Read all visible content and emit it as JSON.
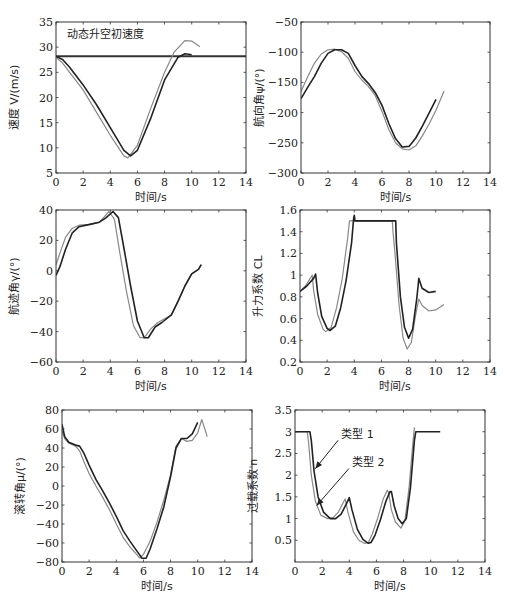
{
  "chart_data": [
    {
      "id": "speed",
      "type": "line",
      "frame": {
        "x": 56,
        "y": 22,
        "w": 190,
        "h": 151
      },
      "xlabel": "时间/s",
      "ylabel": "速度 V/(m/s)",
      "xlim": [
        0,
        14
      ],
      "ylim": [
        5,
        35
      ],
      "xticks": [
        0,
        2,
        4,
        6,
        8,
        10,
        12,
        14
      ],
      "yticks": [
        5,
        10,
        15,
        20,
        25,
        30,
        35
      ],
      "annotations": [
        {
          "text": "动态升空初速度",
          "x": 0.8,
          "y": 31.8
        }
      ],
      "hlines": [
        {
          "y": 28.2,
          "width": 2.2,
          "color": "#333333"
        }
      ],
      "series": [
        {
          "name": "类型 1",
          "color": "#222222",
          "width": 1.6,
          "x": [
            0,
            0.5,
            1,
            2,
            3,
            4,
            5,
            5.5,
            6,
            7,
            8,
            9,
            9.5,
            10
          ],
          "y": [
            28.2,
            27.5,
            26,
            22.5,
            18.5,
            14,
            9.5,
            8.4,
            9.5,
            16,
            23.5,
            28,
            28.7,
            28.5
          ]
        },
        {
          "name": "类型 2",
          "color": "#888888",
          "width": 1.2,
          "x": [
            0,
            0.5,
            1,
            2,
            3,
            4,
            5,
            5.3,
            6,
            7,
            8,
            8.7,
            9.5,
            10,
            10.6
          ],
          "y": [
            28,
            26.8,
            25,
            21.5,
            17,
            12.5,
            8.4,
            8,
            10.5,
            18,
            25,
            29,
            31.3,
            31.2,
            30.1
          ]
        }
      ]
    },
    {
      "id": "heading",
      "type": "line",
      "frame": {
        "x": 301,
        "y": 22,
        "w": 189,
        "h": 151
      },
      "xlabel": "时间/s",
      "ylabel": "航向角ψ/(°)",
      "xlim": [
        0,
        14
      ],
      "ylim": [
        -300,
        -50
      ],
      "xticks": [
        0,
        2,
        4,
        6,
        8,
        10,
        12,
        14
      ],
      "yticks": [
        -300,
        -250,
        -200,
        -150,
        -100,
        -50
      ],
      "annotations": [],
      "hlines": [],
      "series": [
        {
          "name": "类型 1",
          "color": "#222222",
          "width": 1.6,
          "x": [
            0,
            0.5,
            1,
            1.5,
            2,
            2.5,
            3,
            3.5,
            4,
            4.5,
            5,
            5.5,
            6,
            6.5,
            7,
            7.5,
            8,
            8.5,
            9,
            9.5,
            10
          ],
          "y": [
            -177,
            -158,
            -140,
            -118,
            -102,
            -96,
            -96,
            -102,
            -122,
            -140,
            -152,
            -167,
            -188,
            -218,
            -243,
            -257,
            -256,
            -242,
            -222,
            -200,
            -178
          ]
        },
        {
          "name": "类型 2",
          "color": "#888888",
          "width": 1.2,
          "x": [
            0,
            0.5,
            1,
            1.5,
            2,
            2.5,
            3,
            3.5,
            4,
            4.5,
            5,
            5.5,
            6,
            6.5,
            7,
            7.5,
            8,
            8.5,
            9,
            9.5,
            10,
            10.6
          ],
          "y": [
            -165,
            -140,
            -118,
            -103,
            -96,
            -95,
            -99,
            -110,
            -132,
            -146,
            -157,
            -172,
            -198,
            -228,
            -250,
            -260,
            -262,
            -255,
            -238,
            -218,
            -196,
            -164
          ]
        }
      ]
    },
    {
      "id": "flight-path",
      "type": "line",
      "frame": {
        "x": 56,
        "y": 210,
        "w": 190,
        "h": 152
      },
      "xlabel": "时间/s",
      "ylabel": "航迹角γ/(°)",
      "xlim": [
        0,
        14
      ],
      "ylim": [
        -60,
        40
      ],
      "xticks": [
        0,
        2,
        4,
        6,
        8,
        10,
        12,
        14
      ],
      "yticks": [
        -60,
        -40,
        -20,
        0,
        20,
        40
      ],
      "annotations": [],
      "hlines": [],
      "series": [
        {
          "name": "类型 1",
          "color": "#222222",
          "width": 1.6,
          "x": [
            0,
            0.3,
            0.7,
            1.2,
            1.7,
            2.5,
            3.2,
            3.7,
            4.2,
            4.6,
            5,
            5.5,
            6,
            6.5,
            6.8,
            7.3,
            7.8,
            8.5,
            9,
            9.5,
            10,
            10.5,
            10.7
          ],
          "y": [
            -3,
            3,
            14,
            25,
            29,
            30.5,
            32,
            35,
            39,
            35,
            15,
            -10,
            -33,
            -44,
            -44,
            -37,
            -34,
            -29,
            -20,
            -10,
            -2,
            1,
            4
          ]
        },
        {
          "name": "类型 2",
          "color": "#888888",
          "width": 1.2,
          "x": [
            0,
            0.3,
            0.7,
            1.2,
            1.7,
            2.5,
            3.2,
            3.6,
            3.9,
            4.3,
            4.7,
            5.2,
            5.7,
            6.2,
            6.5,
            7,
            7.5,
            8.5,
            9,
            9.5,
            10,
            10.5,
            10.7
          ],
          "y": [
            4,
            12,
            22,
            28,
            30,
            30.5,
            32,
            36,
            39,
            34,
            12,
            -14,
            -36,
            -44,
            -44,
            -38,
            -34,
            -29,
            -20,
            -10,
            -2,
            1,
            4
          ]
        }
      ]
    },
    {
      "id": "lift-coefficient",
      "type": "line",
      "frame": {
        "x": 300,
        "y": 210,
        "w": 190,
        "h": 152
      },
      "xlabel": "时间/s",
      "ylabel": "升力系数 CL",
      "xlim": [
        0,
        14
      ],
      "ylim": [
        0.2,
        1.6
      ],
      "xticks": [
        0,
        2,
        4,
        6,
        8,
        10,
        12,
        14
      ],
      "yticks": [
        0.2,
        0.4,
        0.6,
        0.8,
        1,
        1.2,
        1.4,
        1.6
      ],
      "annotations": [],
      "hlines": [],
      "series": [
        {
          "name": "类型 1",
          "color": "#222222",
          "width": 1.6,
          "x": [
            0,
            0.5,
            1,
            1.15,
            1.3,
            1.6,
            2,
            2.2,
            2.6,
            3,
            3.4,
            3.8,
            3.95,
            4.0,
            4.05,
            5,
            6,
            7.0,
            7.05,
            7.1,
            7.4,
            7.7,
            8.0,
            8.3,
            8.6,
            8.7,
            8.75,
            9,
            9.5,
            10
          ],
          "y": [
            0.85,
            0.9,
            0.97,
            1.01,
            0.84,
            0.62,
            0.51,
            0.49,
            0.53,
            0.7,
            0.95,
            1.3,
            1.52,
            1.55,
            1.5,
            1.5,
            1.5,
            1.5,
            1.5,
            1.3,
            0.8,
            0.52,
            0.42,
            0.5,
            0.78,
            0.9,
            0.97,
            0.88,
            0.84,
            0.85
          ]
        },
        {
          "name": "类型 2",
          "color": "#888888",
          "width": 1.2,
          "x": [
            0,
            0.4,
            0.8,
            0.9,
            1.0,
            1.3,
            1.7,
            1.9,
            2.3,
            2.7,
            3.1,
            3.5,
            3.65,
            3.7,
            5,
            6.8,
            6.85,
            7.0,
            7.3,
            7.6,
            7.9,
            8.2,
            8.5,
            8.7,
            8.75,
            9,
            9.5,
            10,
            10.6
          ],
          "y": [
            0.85,
            0.9,
            0.98,
            1.0,
            0.86,
            0.64,
            0.5,
            0.48,
            0.52,
            0.7,
            0.96,
            1.33,
            1.5,
            1.5,
            1.5,
            1.5,
            1.4,
            1.2,
            0.72,
            0.42,
            0.32,
            0.38,
            0.62,
            0.75,
            0.78,
            0.72,
            0.67,
            0.68,
            0.73
          ]
        }
      ]
    },
    {
      "id": "roll-angle",
      "type": "line",
      "frame": {
        "x": 62,
        "y": 410,
        "w": 190,
        "h": 152
      },
      "xlabel": "时间/s",
      "ylabel": "滚转角μ/(°)",
      "xlim": [
        0,
        14
      ],
      "ylim": [
        -80,
        80
      ],
      "xticks": [
        0,
        2,
        4,
        6,
        8,
        10,
        12,
        14
      ],
      "yticks": [
        -80,
        -60,
        -40,
        -20,
        0,
        20,
        40,
        60,
        80
      ],
      "annotations": [],
      "hlines": [],
      "series": [
        {
          "name": "类型 1",
          "color": "#222222",
          "width": 1.6,
          "x": [
            0,
            0.2,
            0.5,
            1,
            1.3,
            1.6,
            2,
            2.5,
            3,
            3.5,
            4,
            4.5,
            5,
            5.5,
            5.9,
            6.2,
            6.5,
            7,
            7.5,
            8,
            8.4,
            8.8,
            9.2,
            9.6,
            10
          ],
          "y": [
            65,
            52,
            46,
            43,
            42,
            35,
            22,
            7,
            -5,
            -18,
            -32,
            -47,
            -58,
            -68,
            -76,
            -76,
            -66,
            -45,
            -22,
            10,
            40,
            50,
            50,
            55,
            67
          ]
        },
        {
          "name": "类型 2",
          "color": "#888888",
          "width": 1.2,
          "x": [
            0,
            0.2,
            0.5,
            1,
            1.3,
            1.6,
            2,
            2.5,
            3,
            3.5,
            4,
            4.5,
            5,
            5.5,
            5.75,
            6,
            6.5,
            7,
            7.5,
            8,
            8.4,
            8.8,
            9.2,
            9.6,
            10,
            10.3,
            10.7
          ],
          "y": [
            58,
            50,
            45,
            42,
            37,
            26,
            13,
            0,
            -12,
            -25,
            -40,
            -54,
            -64,
            -72,
            -76,
            -72,
            -58,
            -38,
            -15,
            12,
            42,
            50,
            47,
            48,
            56,
            70,
            52
          ]
        }
      ]
    },
    {
      "id": "load-factor",
      "type": "line",
      "frame": {
        "x": 295,
        "y": 410,
        "w": 190,
        "h": 152
      },
      "xlabel": "时间/s",
      "ylabel": "过载系数 n",
      "xlim": [
        0,
        14
      ],
      "ylim": [
        0,
        3.5
      ],
      "xticks": [
        0,
        2,
        4,
        6,
        8,
        10,
        12,
        14
      ],
      "yticks": [
        0.5,
        1,
        1.5,
        2,
        2.5,
        3,
        3.5
      ],
      "annotations": [
        {
          "text": "类型 1",
          "x": 3.4,
          "y": 2.85,
          "arrow_to": [
            1.5,
            2.15
          ]
        },
        {
          "text": "类型 2",
          "x": 4.2,
          "y": 2.2,
          "arrow_to": [
            1.6,
            1.3
          ]
        }
      ],
      "hlines": [],
      "series": [
        {
          "name": "类型 1",
          "color": "#222222",
          "width": 1.6,
          "x": [
            0,
            1.1,
            1.2,
            1.4,
            1.7,
            2.1,
            2.6,
            3.0,
            3.4,
            3.8,
            4.0,
            4.2,
            4.6,
            5.0,
            5.4,
            5.6,
            5.9,
            6.3,
            6.7,
            7.0,
            7.1,
            7.3,
            7.6,
            7.9,
            8.2,
            8.5,
            8.8,
            8.9,
            10.7
          ],
          "y": [
            3,
            3,
            2.8,
            2.1,
            1.5,
            1.15,
            1.0,
            1.0,
            1.1,
            1.35,
            1.48,
            1.2,
            0.75,
            0.52,
            0.43,
            0.45,
            0.62,
            0.98,
            1.4,
            1.62,
            1.62,
            1.3,
            1.0,
            0.88,
            1.0,
            1.7,
            2.8,
            3.0,
            3.0
          ]
        },
        {
          "name": "类型 2",
          "color": "#888888",
          "width": 1.2,
          "x": [
            0,
            0.9,
            1.0,
            1.2,
            1.5,
            1.9,
            2.4,
            2.8,
            3.2,
            3.6,
            3.7,
            3.9,
            4.3,
            4.7,
            5.1,
            5.4,
            5.7,
            6.1,
            6.5,
            6.8,
            6.9,
            7.1,
            7.4,
            7.8,
            8.1,
            8.4,
            8.7,
            8.8
          ],
          "y": [
            3,
            3,
            2.75,
            2.0,
            1.4,
            1.08,
            1.0,
            1.02,
            1.15,
            1.4,
            1.45,
            1.15,
            0.7,
            0.5,
            0.43,
            0.45,
            0.65,
            1.02,
            1.45,
            1.65,
            1.6,
            1.2,
            0.92,
            0.78,
            0.95,
            1.7,
            2.8,
            3.1
          ]
        }
      ]
    }
  ]
}
